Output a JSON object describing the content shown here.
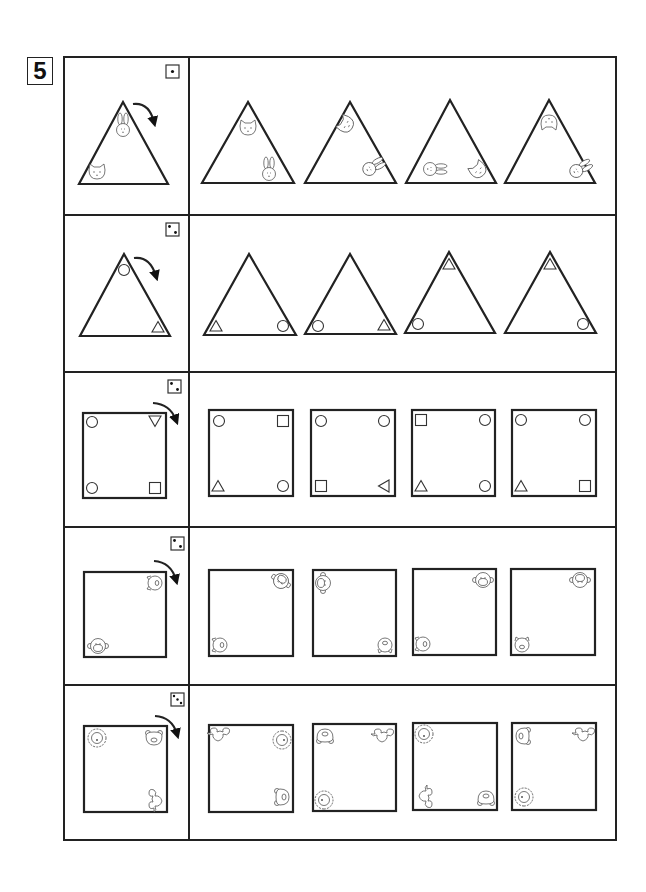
{
  "puzzle": {
    "number": "5",
    "instruction_arrow": "clockwise-rotation-arrow",
    "rows": [
      {
        "die": 1,
        "shape": "triangle",
        "reference": {
          "top": "rabbit",
          "bottom_left": "cat",
          "bottom_right": ""
        },
        "options": [
          {
            "top": "cat",
            "bottom_left": "",
            "bottom_right": "rabbit"
          },
          {
            "top": "cat (rotated)",
            "bottom_left": "",
            "bottom_right": "rabbit (rotated)"
          },
          {
            "top": "",
            "bottom_left": "rabbit (rotated)",
            "bottom_right": "cat (rotated)"
          },
          {
            "top": "cat (upside-down)",
            "bottom_left": "",
            "bottom_right": "rabbit (rotated)"
          }
        ]
      },
      {
        "die": 2,
        "shape": "triangle",
        "reference": {
          "top": "circle",
          "bottom_left": "",
          "bottom_right": "triangle"
        },
        "options": [
          {
            "top": "",
            "bottom_left": "triangle",
            "bottom_right": "circle"
          },
          {
            "top": "",
            "bottom_left": "circle",
            "bottom_right": "triangle"
          },
          {
            "top": "triangle",
            "bottom_left": "circle",
            "bottom_right": ""
          },
          {
            "top": "triangle",
            "bottom_left": "",
            "bottom_right": "circle"
          }
        ]
      },
      {
        "die": 2,
        "shape": "square",
        "reference": {
          "top_left": "circle",
          "top_right": "triangle-down",
          "bottom_left": "circle",
          "bottom_right": "square"
        },
        "options": [
          {
            "top_left": "circle",
            "top_right": "square",
            "bottom_left": "triangle",
            "bottom_right": "circle"
          },
          {
            "top_left": "circle",
            "top_right": "circle",
            "bottom_left": "square",
            "bottom_right": "triangle-left"
          },
          {
            "top_left": "square",
            "top_right": "circle",
            "bottom_left": "triangle",
            "bottom_right": "circle"
          },
          {
            "top_left": "circle",
            "top_right": "circle",
            "bottom_left": "triangle",
            "bottom_right": "square"
          }
        ]
      },
      {
        "die": 2,
        "shape": "square",
        "reference": {
          "top_left": "",
          "top_right": "pig (rotated)",
          "bottom_left": "monkey",
          "bottom_right": ""
        },
        "options": [
          {
            "top_left": "",
            "top_right": "monkey (rotated)",
            "bottom_left": "pig (rotated)",
            "bottom_right": ""
          },
          {
            "top_left": "monkey (rotated)",
            "top_right": "",
            "bottom_left": "",
            "bottom_right": "pig (upside-down)"
          },
          {
            "top_left": "",
            "top_right": "monkey",
            "bottom_left": "pig (rotated)",
            "bottom_right": ""
          },
          {
            "top_left": "",
            "top_right": "monkey (upside-down)",
            "bottom_left": "pig",
            "bottom_right": ""
          }
        ]
      },
      {
        "die": 3,
        "shape": "square",
        "reference": {
          "top_left": "lion",
          "top_right": "bear",
          "bottom_left": "",
          "bottom_right": "sheep (rotated)"
        },
        "options": [
          {
            "top_left": "sheep",
            "top_right": "lion (rotated)",
            "bottom_left": "",
            "bottom_right": "bear (rotated)"
          },
          {
            "top_left": "bear (upside-down)",
            "top_right": "sheep",
            "bottom_left": "lion (rotated)",
            "bottom_right": ""
          },
          {
            "top_left": "lion",
            "top_right": "",
            "bottom_left": "sheep (rotated)",
            "bottom_right": "bear (upside-down)"
          },
          {
            "top_left": "bear (rotated)",
            "top_right": "sheep",
            "bottom_left": "lion (rotated)",
            "bottom_right": ""
          }
        ]
      }
    ]
  }
}
